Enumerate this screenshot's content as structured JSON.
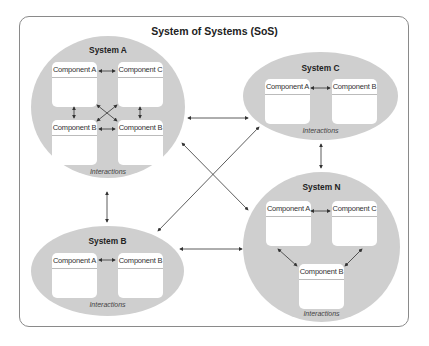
{
  "diagram": {
    "title": "System of Systems (SoS)",
    "interactions_label": "Interactions",
    "systems": {
      "a": {
        "name": "System A",
        "components": [
          "Component A",
          "Component C",
          "Component B",
          "Component B"
        ]
      },
      "b": {
        "name": "System B",
        "components": [
          "Component A",
          "Component B"
        ]
      },
      "c": {
        "name": "System C",
        "components": [
          "Component A",
          "Component B"
        ]
      },
      "n": {
        "name": "System N",
        "components": [
          "Component A",
          "Component C",
          "Component B"
        ]
      }
    },
    "connections": [
      {
        "from": "System A",
        "to": "System C",
        "type": "bidirectional"
      },
      {
        "from": "System A",
        "to": "System N",
        "type": "bidirectional"
      },
      {
        "from": "System A",
        "to": "System B",
        "type": "bidirectional"
      },
      {
        "from": "System B",
        "to": "System C",
        "type": "bidirectional"
      },
      {
        "from": "System B",
        "to": "System N",
        "type": "bidirectional"
      },
      {
        "from": "System C",
        "to": "System N",
        "type": "bidirectional"
      }
    ],
    "colors": {
      "system_fill": "#cfcfcf",
      "component_fill": "#ffffff",
      "arrow": "#333333",
      "frame": "#8a8a8a"
    }
  }
}
